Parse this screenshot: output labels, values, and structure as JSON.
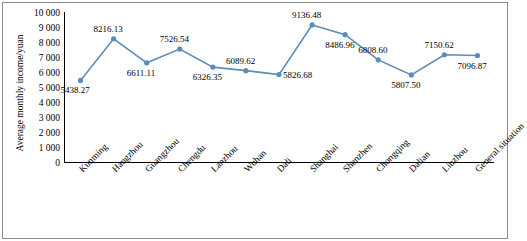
{
  "chart_data": {
    "type": "line",
    "title": "",
    "xlabel": "",
    "ylabel": "Average monthly income/yuan",
    "ylim": [
      0,
      10000
    ],
    "ytick_labels": [
      "10 000",
      "9 000",
      "8 000",
      "7 000",
      "6 000",
      "5 000",
      "4 000",
      "3 000",
      "2 000",
      "1 000",
      "0"
    ],
    "ytick_values": [
      10000,
      9000,
      8000,
      7000,
      6000,
      5000,
      4000,
      3000,
      2000,
      1000,
      0
    ],
    "grid": false,
    "legend": "none",
    "series_color": "#5b8db8",
    "categories": [
      "Kunming",
      "Hangzhou",
      "Guangzhou",
      "Chengdu",
      "Lanzhou",
      "Wuhan",
      "Dali",
      "Shanghai",
      "Shenzhen",
      "Chongqing",
      "Dalian",
      "Liuzhou",
      "General situation"
    ],
    "values": [
      5438.27,
      8216.13,
      6611.11,
      7526.54,
      6326.35,
      6089.62,
      5826.68,
      9136.48,
      8486.96,
      6808.6,
      5807.5,
      7150.62,
      7096.87
    ],
    "point_labels": [
      "5438.27",
      "8216.13",
      "6611.11",
      "7526.54",
      "6326.35",
      "6089.62",
      "5826.68",
      "9136.48",
      "8486.96",
      "6808.60",
      "5807.50",
      "7150.62",
      "7096.87"
    ],
    "label_positions": [
      "below",
      "above",
      "below",
      "above",
      "below",
      "above",
      "right",
      "above",
      "below",
      "above",
      "below",
      "above",
      "below"
    ]
  }
}
